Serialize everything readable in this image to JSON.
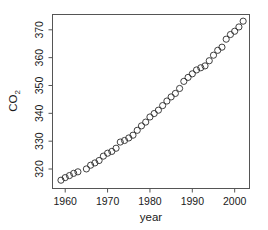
{
  "chart_data": {
    "type": "scatter",
    "title": "",
    "xlabel": "year",
    "ylabel": "CO2",
    "ylabel_display": "CO",
    "ylabel_subscript": "2",
    "xlim": [
      1957.0,
      2003.5
    ],
    "ylim": [
      313.0,
      375.5
    ],
    "xticks": [
      1960,
      1970,
      1980,
      1990,
      2000
    ],
    "xtick_labels": [
      "1960",
      "1970",
      "1980",
      "1990",
      "2000"
    ],
    "yticks": [
      320,
      330,
      340,
      350,
      360,
      370
    ],
    "ytick_labels": [
      "320",
      "330",
      "340",
      "350",
      "360",
      "370"
    ],
    "grid": false,
    "legend": false,
    "marker": "open-circle",
    "marker_size": 3.1,
    "point_color": "#2b2b2b",
    "frame_color": "#555555",
    "background": "#ffffff",
    "x": [
      1959,
      1960,
      1961,
      1962,
      1963,
      1965,
      1966,
      1967,
      1968,
      1969,
      1970,
      1971,
      1972,
      1973,
      1974,
      1975,
      1976,
      1977,
      1978,
      1979,
      1980,
      1981,
      1982,
      1983,
      1984,
      1985,
      1986,
      1987,
      1988,
      1989,
      1990,
      1991,
      1992,
      1993,
      1994,
      1995,
      1996,
      1997,
      1998,
      1999,
      2000,
      2001,
      2002
    ],
    "y": [
      315.98,
      316.91,
      317.64,
      318.45,
      318.99,
      320.03,
      321.37,
      322.18,
      323.05,
      324.62,
      325.68,
      326.32,
      327.46,
      329.68,
      330.25,
      331.15,
      332.15,
      333.9,
      335.5,
      336.85,
      338.69,
      339.93,
      341.13,
      342.78,
      344.42,
      345.9,
      347.15,
      348.93,
      351.48,
      352.91,
      354.19,
      355.59,
      356.37,
      357.04,
      358.89,
      360.88,
      362.64,
      363.76,
      366.63,
      368.31,
      369.48,
      371.02,
      373.1
    ],
    "data_gap_note": "no observations plotted for 1964",
    "source_description": "Annual mean atmospheric CO2 concentration (ppm)"
  },
  "axes": {
    "x_axis_label": "year",
    "y_axis_label_main": "CO",
    "y_axis_label_sub": "2"
  }
}
